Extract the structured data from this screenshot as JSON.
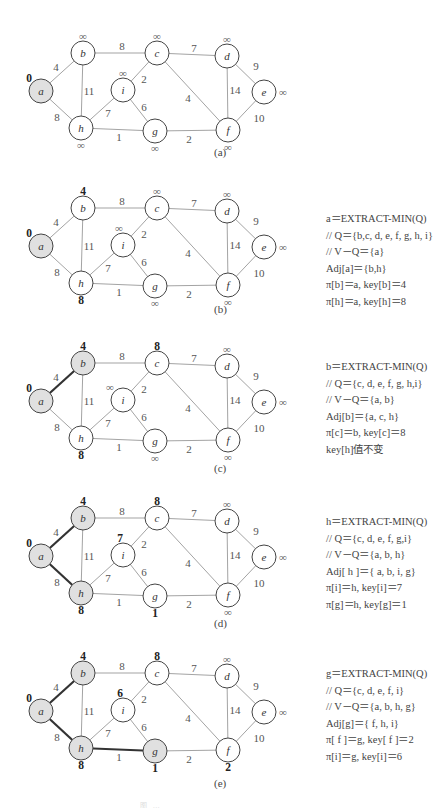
{
  "graph": {
    "nodes": {
      "a": {
        "x": 41,
        "y": 91
      },
      "b": {
        "x": 83,
        "y": 53
      },
      "c": {
        "x": 157,
        "y": 53
      },
      "d": {
        "x": 227,
        "y": 56
      },
      "e": {
        "x": 264,
        "y": 92
      },
      "f": {
        "x": 228,
        "y": 130
      },
      "g": {
        "x": 155,
        "y": 131
      },
      "h": {
        "x": 81,
        "y": 128
      },
      "i": {
        "x": 123,
        "y": 90
      }
    },
    "edges": [
      {
        "u": "a",
        "v": "b",
        "w": "4",
        "lx": 56,
        "ly": 67
      },
      {
        "u": "a",
        "v": "h",
        "w": "8",
        "lx": 57,
        "ly": 117
      },
      {
        "u": "b",
        "v": "c",
        "w": "8",
        "lx": 122,
        "ly": 46
      },
      {
        "u": "b",
        "v": "h",
        "w": "11",
        "lx": 89,
        "ly": 91
      },
      {
        "u": "c",
        "v": "d",
        "w": "7",
        "lx": 194,
        "ly": 48
      },
      {
        "u": "c",
        "v": "i",
        "w": "2",
        "lx": 144,
        "ly": 79
      },
      {
        "u": "c",
        "v": "f",
        "w": "4",
        "lx": 188,
        "ly": 98
      },
      {
        "u": "d",
        "v": "e",
        "w": "9",
        "lx": 256,
        "ly": 66
      },
      {
        "u": "d",
        "v": "f",
        "w": "14",
        "lx": 235,
        "ly": 90
      },
      {
        "u": "e",
        "v": "f",
        "w": "10",
        "lx": 259,
        "ly": 118
      },
      {
        "u": "h",
        "v": "i",
        "w": "7",
        "lx": 108,
        "ly": 113
      },
      {
        "u": "h",
        "v": "g",
        "w": "1",
        "lx": 119,
        "ly": 137
      },
      {
        "u": "i",
        "v": "g",
        "w": "6",
        "lx": 144,
        "ly": 107
      },
      {
        "u": "g",
        "v": "f",
        "w": "2",
        "lx": 189,
        "ly": 139
      }
    ]
  },
  "panels": [
    {
      "id": "a",
      "top": 0,
      "label": "(a)",
      "label_pos": {
        "x": 222,
        "y": 153
      },
      "done": [
        "a"
      ],
      "tree_edges": [],
      "keys": {
        "a": {
          "text": "0",
          "fin": true,
          "dx": -12,
          "dy": -13
        },
        "b": {
          "text": "∞",
          "fin": false,
          "dx": 0,
          "dy": -17
        },
        "c": {
          "text": "∞",
          "fin": false,
          "dx": 0,
          "dy": -17
        },
        "d": {
          "text": "∞",
          "fin": false,
          "dx": 0,
          "dy": -17
        },
        "e": {
          "text": "∞",
          "fin": false,
          "dx": 19,
          "dy": 0
        },
        "f": {
          "text": "∞",
          "fin": false,
          "dx": 0,
          "dy": 17
        },
        "g": {
          "text": "∞",
          "fin": false,
          "dx": 0,
          "dy": 17
        },
        "h": {
          "text": "∞",
          "fin": false,
          "dx": 0,
          "dy": 17
        },
        "i": {
          "text": "∞",
          "fin": false,
          "dx": 0,
          "dy": -17
        }
      },
      "notes": []
    },
    {
      "id": "b",
      "top": 155,
      "label": "(b)",
      "label_pos": {
        "x": 222,
        "y": 155
      },
      "done": [
        "a"
      ],
      "tree_edges": [],
      "keys": {
        "a": {
          "text": "0",
          "fin": true,
          "dx": -12,
          "dy": -13
        },
        "b": {
          "text": "4",
          "fin": true,
          "dx": 0,
          "dy": -17
        },
        "c": {
          "text": "∞",
          "fin": false,
          "dx": 0,
          "dy": -17
        },
        "d": {
          "text": "∞",
          "fin": false,
          "dx": 0,
          "dy": -17
        },
        "e": {
          "text": "∞",
          "fin": false,
          "dx": 19,
          "dy": 0
        },
        "f": {
          "text": "∞",
          "fin": false,
          "dx": 0,
          "dy": 17
        },
        "g": {
          "text": "∞",
          "fin": false,
          "dx": 0,
          "dy": 17
        },
        "h": {
          "text": "8",
          "fin": true,
          "dx": 0,
          "dy": 17
        },
        "i": {
          "text": "∞",
          "fin": false,
          "dx": -4,
          "dy": -17
        }
      },
      "notes_top": 56,
      "notes": [
        "a＝EXTRACT-MIN(Q)",
        "// Q＝{b,c, d, e, f, g, h, i}",
        "// V－Q＝{a}",
        "Adj[a]＝{b,h}",
        "π[b]＝a, key[b]＝4",
        "π[h]＝a, key[h]＝8"
      ]
    },
    {
      "id": "c",
      "top": 310,
      "label": "(c)",
      "label_pos": {
        "x": 222,
        "y": 159
      },
      "done": [
        "a",
        "b"
      ],
      "tree_edges": [
        [
          "a",
          "b"
        ]
      ],
      "keys": {
        "a": {
          "text": "0",
          "fin": true,
          "dx": -12,
          "dy": -13
        },
        "b": {
          "text": "4",
          "fin": true,
          "dx": 0,
          "dy": -17
        },
        "c": {
          "text": "8",
          "fin": true,
          "dx": 0,
          "dy": -17
        },
        "d": {
          "text": "∞",
          "fin": false,
          "dx": 0,
          "dy": -17
        },
        "e": {
          "text": "∞",
          "fin": false,
          "dx": 19,
          "dy": 0
        },
        "f": {
          "text": "∞",
          "fin": false,
          "dx": 0,
          "dy": 17
        },
        "g": {
          "text": "∞",
          "fin": false,
          "dx": 0,
          "dy": 17
        },
        "h": {
          "text": "8",
          "fin": true,
          "dx": 0,
          "dy": 17
        },
        "i": {
          "text": "∞",
          "fin": false,
          "dx": -13,
          "dy": -13
        }
      },
      "notes_top": 49,
      "notes": [
        "b＝EXTRACT-MIN(Q)",
        "// Q＝{c, d, e, f, g, h,i}",
        "// V－Q＝{a, b}",
        "Adj[b]＝{a, c, h}",
        "π[c]＝b, key[c]＝8",
        "key[h]值不变"
      ]
    },
    {
      "id": "d",
      "top": 465,
      "label": "(d)",
      "label_pos": {
        "x": 222,
        "y": 159
      },
      "done": [
        "a",
        "b",
        "h"
      ],
      "tree_edges": [
        [
          "a",
          "b"
        ],
        [
          "a",
          "h"
        ]
      ],
      "keys": {
        "a": {
          "text": "0",
          "fin": true,
          "dx": -12,
          "dy": -13
        },
        "b": {
          "text": "4",
          "fin": true,
          "dx": 0,
          "dy": -17
        },
        "c": {
          "text": "8",
          "fin": true,
          "dx": 0,
          "dy": -17
        },
        "d": {
          "text": "∞",
          "fin": false,
          "dx": 0,
          "dy": -17
        },
        "e": {
          "text": "∞",
          "fin": false,
          "dx": 19,
          "dy": 0
        },
        "f": {
          "text": "∞",
          "fin": false,
          "dx": 0,
          "dy": 17
        },
        "g": {
          "text": "1",
          "fin": true,
          "dx": 0,
          "dy": 17
        },
        "h": {
          "text": "8",
          "fin": true,
          "dx": 0,
          "dy": 17
        },
        "i": {
          "text": "7",
          "fin": true,
          "dx": -3,
          "dy": -17
        }
      },
      "notes_top": 49,
      "notes": [
        "h＝EXTRACT-MIN(Q)",
        "// Q＝{c, d, e, f, g,i}",
        "// V－Q＝{a, b, h}",
        "Adj[ h ]＝{ a, b, i, g}",
        "π[i]＝h, key[i]＝7",
        "π[g]＝h, key[g]＝1"
      ]
    },
    {
      "id": "e",
      "top": 620,
      "label": "(e)",
      "label_pos": {
        "x": 222,
        "y": 164
      },
      "done": [
        "a",
        "b",
        "h",
        "g"
      ],
      "tree_edges": [
        [
          "a",
          "b"
        ],
        [
          "a",
          "h"
        ],
        [
          "h",
          "g"
        ]
      ],
      "keys": {
        "a": {
          "text": "0",
          "fin": true,
          "dx": -12,
          "dy": -13
        },
        "b": {
          "text": "4",
          "fin": true,
          "dx": 0,
          "dy": -17
        },
        "c": {
          "text": "8",
          "fin": true,
          "dx": 0,
          "dy": -17
        },
        "d": {
          "text": "∞",
          "fin": false,
          "dx": 0,
          "dy": -17
        },
        "e": {
          "text": "∞",
          "fin": false,
          "dx": 19,
          "dy": 0
        },
        "f": {
          "text": "2",
          "fin": true,
          "dx": 0,
          "dy": 17
        },
        "g": {
          "text": "1",
          "fin": true,
          "dx": 0,
          "dy": 17
        },
        "h": {
          "text": "8",
          "fin": true,
          "dx": 0,
          "dy": 17
        },
        "i": {
          "text": "6",
          "fin": true,
          "dx": -3,
          "dy": -17
        }
      },
      "notes_top": 46,
      "notes": [
        "g＝EXTRACT-MIN(Q)",
        "// Q＝{c, d, e, f, i}",
        "// V－Q＝{a, b, h, g}",
        "Adj[g]＝{ f, h, i}",
        "π[ f ]＝g, key[ f ]＝2",
        "π[i]＝g, key[i]＝6"
      ]
    }
  ],
  "caption": "图 …"
}
